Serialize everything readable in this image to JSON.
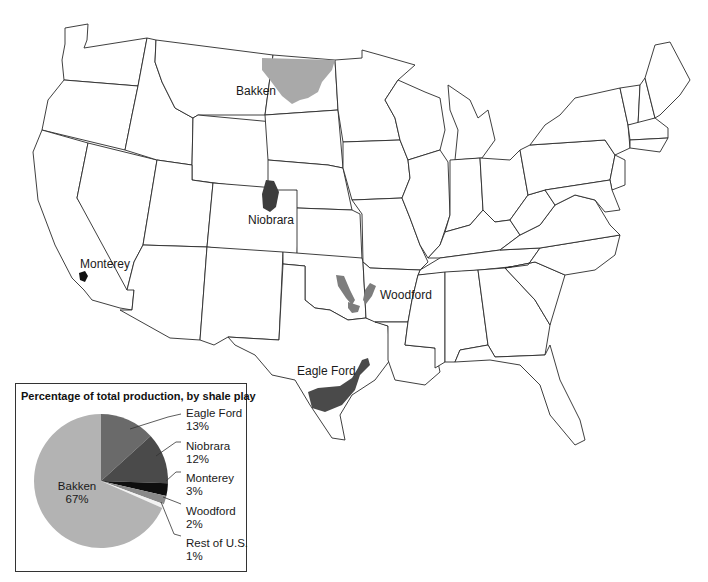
{
  "map": {
    "labels": {
      "bakken": "Bakken",
      "niobrara": "Niobrara",
      "monterey": "Monterey",
      "woodford": "Woodford",
      "eagle_ford": "Eagle Ford"
    },
    "colors": {
      "bakken": "#a9a9a9",
      "niobrara": "#3d3d3d",
      "monterey": "#111111",
      "woodford": "#7d7d7d",
      "eagle_ford": "#4a4a4a",
      "state_stroke": "#2a2a2a",
      "background": "#ffffff"
    }
  },
  "inset": {
    "title": "Percentage of total production, by shale play",
    "legend": [
      {
        "name": "Eagle Ford",
        "pct": "13%"
      },
      {
        "name": "Niobrara",
        "pct": "12%"
      },
      {
        "name": "Monterey",
        "pct": "3%"
      },
      {
        "name": "Woodford",
        "pct": "2%"
      },
      {
        "name": "Rest of U.S.",
        "pct": "1%"
      }
    ],
    "bakken_label": "Bakken",
    "bakken_pct": "67%"
  },
  "chart_data": {
    "type": "pie",
    "title": "Percentage of total production, by shale play",
    "categories": [
      "Eagle Ford",
      "Niobrara",
      "Monterey",
      "Woodford",
      "Rest of U.S.",
      "Bakken"
    ],
    "values": [
      13,
      12,
      3,
      2,
      1,
      67
    ],
    "unit": "%",
    "colors": [
      "#6a6a6a",
      "#4a4a4a",
      "#0e0e0e",
      "#8a8a8a",
      "#f2f2f2",
      "#b3b3b3"
    ],
    "start_angle_deg": 0,
    "direction": "clockwise from 12 o'clock",
    "legend_position": "right, with leader lines"
  }
}
